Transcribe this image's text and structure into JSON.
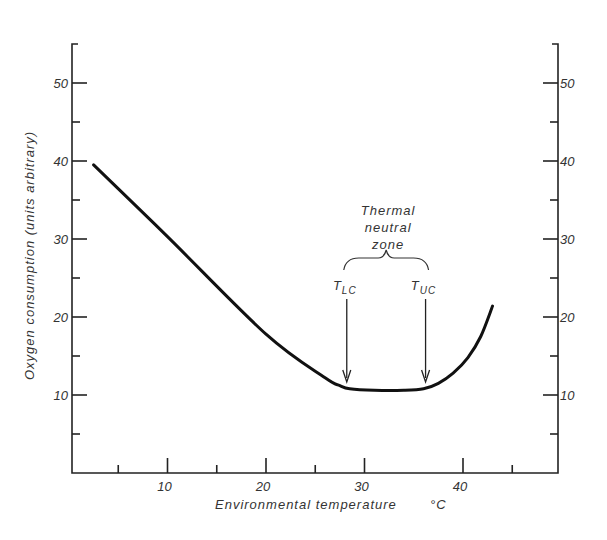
{
  "chart_data": {
    "type": "line",
    "title": "",
    "xlabel": "Environmental temperature",
    "xunit": "°C",
    "ylabel": "Oxygen consumption (units arbitrary)",
    "xlim": [
      0,
      50
    ],
    "ylim": [
      0,
      55
    ],
    "x_major_ticks": [
      10,
      20,
      30,
      40
    ],
    "x_minor_ticks": [
      5,
      15,
      25,
      45
    ],
    "y_major_ticks": [
      10,
      20,
      30,
      40,
      50
    ],
    "y_minor_ticks": [
      5,
      15,
      25,
      35,
      45
    ],
    "right_axis_ticks": [
      10,
      20,
      30,
      40,
      50
    ],
    "grid": false,
    "series": [
      {
        "name": "Oxygen consumption",
        "points": [
          [
            2.5,
            39.5
          ],
          [
            10,
            30.3
          ],
          [
            20,
            17.8
          ],
          [
            26,
            12.2
          ],
          [
            27.5,
            11.2
          ],
          [
            28.5,
            10.8
          ],
          [
            31,
            10.6
          ],
          [
            34,
            10.6
          ],
          [
            36,
            10.8
          ],
          [
            37.5,
            11.5
          ],
          [
            39,
            12.8
          ],
          [
            40.5,
            14.8
          ],
          [
            41.8,
            17.5
          ],
          [
            43,
            21.4
          ]
        ]
      }
    ],
    "annotations": {
      "zone_label": [
        "Thermal",
        "neutral",
        "zone"
      ],
      "lower_critical": {
        "label": "T",
        "sub": "lc",
        "x": 28.2
      },
      "upper_critical": {
        "label": "T",
        "sub": "uc",
        "x": 36.2
      }
    }
  }
}
